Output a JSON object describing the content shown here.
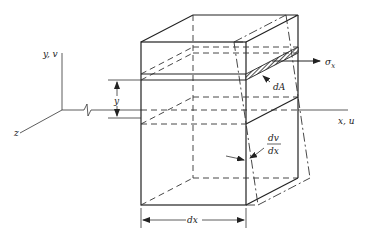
{
  "figure": {
    "axes": {
      "y_label": "y, v",
      "x_label": "x, u",
      "z_label": "z"
    },
    "labels": {
      "stress": "σ",
      "stress_sub": "x",
      "area": "dA",
      "height": "y",
      "rotation_num": "dv",
      "rotation_den": "dx",
      "length": "dx"
    },
    "colors": {
      "line": "#222222",
      "background": "#ffffff"
    }
  }
}
